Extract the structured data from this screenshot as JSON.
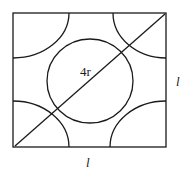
{
  "diagram": {
    "labels": {
      "diagonal": "4r",
      "bottom_edge": "l",
      "right_edge": "l"
    },
    "shapes": {
      "square": {
        "x": 13,
        "y": 13,
        "width": 153,
        "height": 134
      },
      "center_atom": {
        "cx": 90,
        "cy": 81,
        "rx": 43,
        "ry": 42
      },
      "corner_atoms": [
        "top-left",
        "top-right",
        "bottom-left",
        "bottom-right"
      ],
      "diagonal_line": {
        "x1": 15,
        "y1": 146,
        "x2": 165,
        "y2": 14
      }
    },
    "colors": {
      "line": "#1a1a1a",
      "background": "#ffffff"
    }
  }
}
